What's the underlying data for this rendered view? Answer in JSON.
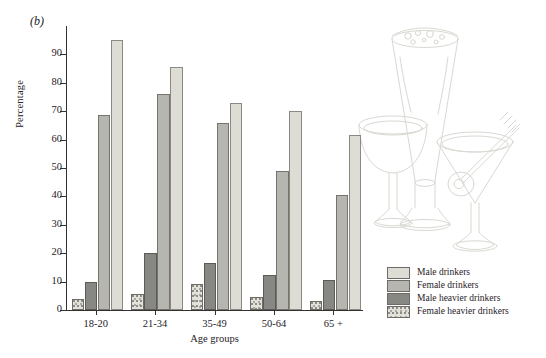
{
  "figure": {
    "panel_label": "(b)"
  },
  "chart_data": {
    "type": "bar",
    "title": "",
    "xlabel": "Age groups",
    "ylabel": "Percentage",
    "categories": [
      "18-20",
      "21-34",
      "35-49",
      "50-64",
      "65 +"
    ],
    "series": [
      {
        "name": "Female heavier drinkers",
        "key": "female-heavier",
        "color": "#e2e1da",
        "values": [
          4,
          5.5,
          9,
          4.5,
          3
        ]
      },
      {
        "name": "Male heavier drinkers",
        "key": "male-heavier",
        "color": "#878784",
        "values": [
          10,
          20,
          16.5,
          12.5,
          10.5
        ]
      },
      {
        "name": "Female drinkers",
        "key": "female-drinkers",
        "color": "#b6b6b1",
        "values": [
          68.5,
          76,
          66,
          49,
          40.5
        ]
      },
      {
        "name": "Male drinkers",
        "key": "male-drinkers",
        "color": "#dddcd5",
        "values": [
          95,
          85.5,
          73,
          70,
          61.5
        ]
      }
    ],
    "ylim": [
      0,
      100
    ],
    "yticks": [
      0,
      10,
      20,
      30,
      40,
      50,
      60,
      70,
      80,
      90
    ],
    "ytick_labels": [
      "0",
      "10",
      "20",
      "30",
      "40",
      "50",
      "60",
      "70",
      "80",
      "90"
    ],
    "grid": false,
    "legend_position": "bottom-right",
    "legend_order": [
      "Male drinkers",
      "Female drinkers",
      "Male heavier drinkers",
      "Female heavier drinkers"
    ],
    "bar_order_in_group": [
      "Female heavier drinkers",
      "Male heavier drinkers",
      "Female drinkers",
      "Male drinkers"
    ]
  },
  "legend": {
    "items": [
      {
        "label": "Male drinkers",
        "swatch": "male-drinkers"
      },
      {
        "label": "Female drinkers",
        "swatch": "female-drinkers"
      },
      {
        "label": "Male heavier drinkers",
        "swatch": "male-heavier"
      },
      {
        "label": "Female heavier drinkers",
        "swatch": "female-heavier"
      }
    ]
  },
  "decoration": {
    "illustration_name": "glassware-line-art",
    "elements": [
      "pilsner-glass",
      "wine-goblet",
      "martini-glass-with-olive"
    ]
  }
}
